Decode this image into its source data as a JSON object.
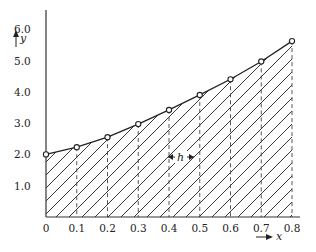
{
  "chart_data": {
    "type": "line",
    "title": "",
    "xlabel": "x",
    "ylabel": "y",
    "x": [
      0,
      0.1,
      0.2,
      0.3,
      0.4,
      0.5,
      0.6,
      0.7,
      0.8
    ],
    "values": [
      2.0,
      2.23,
      2.55,
      2.97,
      3.42,
      3.9,
      4.4,
      4.97,
      5.62
    ],
    "xticks": [
      "0",
      "0.1",
      "0.2",
      "0.3",
      "0.4",
      "0.5",
      "0.6",
      "0.7",
      "0.8"
    ],
    "yticks": [
      "1.0",
      "2.0",
      "3.0",
      "4.0",
      "5.0",
      "6.0"
    ],
    "xlim": [
      0,
      0.8
    ],
    "ylim": [
      0,
      6.5
    ],
    "grid": false,
    "fill": "hatched area under polyline",
    "annotations": [
      {
        "text": "h",
        "meaning": "step width between dashed ordinates",
        "between": [
          0.4,
          0.5
        ],
        "y": 1.9
      }
    ]
  },
  "labels": {
    "x_axis": "x",
    "y_axis": "y",
    "h": "h"
  }
}
